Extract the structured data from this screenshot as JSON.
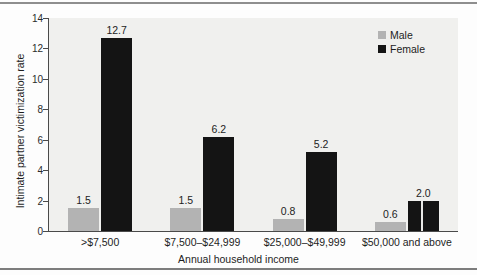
{
  "chart_data": {
    "type": "bar",
    "title": "",
    "xlabel": "Annual household income",
    "ylabel": "Intimate partner victimization rate",
    "categories": [
      ">$7,500",
      "$7,500–$24,999",
      "$25,000–$49,999",
      "$50,000 and above"
    ],
    "series": [
      {
        "name": "Male",
        "color": "#b3b3b3",
        "values": [
          1.5,
          1.5,
          0.8,
          0.6
        ],
        "labels": [
          "1.5",
          "1.5",
          "0.8",
          "0.6"
        ]
      },
      {
        "name": "Female",
        "color": "#141414",
        "values": [
          12.7,
          6.2,
          5.2,
          2.0
        ],
        "labels": [
          "12.7",
          "6.2",
          "5.2",
          "2.0"
        ]
      }
    ],
    "ylim": [
      0,
      14
    ],
    "yticks": [
      0,
      2,
      4,
      6,
      8,
      10,
      12,
      14
    ],
    "ytick_labels": [
      "0",
      "2",
      "4",
      "6",
      "8",
      "10",
      "12",
      "14"
    ],
    "grid": false,
    "legend_position": "top-right",
    "legend_entries": [
      "Male",
      "Female"
    ],
    "plot_background": "#f0f0ee",
    "axis_color": "#4a4a4a"
  }
}
